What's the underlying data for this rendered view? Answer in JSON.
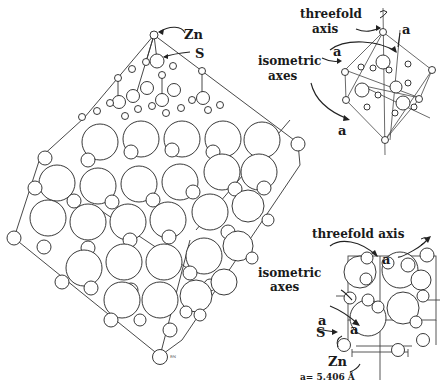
{
  "figure": {
    "panels": [
      {
        "id": "large-crystal",
        "labels": {
          "zn": "Zn",
          "s": "S",
          "corner_mark": "ᴿᴺ"
        }
      },
      {
        "id": "unit-cell-top",
        "labels": {
          "threefold_axis_line1": "threefold",
          "threefold_axis_line2": "axis",
          "isometric_axes_line1": "isometric",
          "isometric_axes_line2": "axes",
          "axis_a_top": "a",
          "axis_a_left": "a",
          "axis_a_bottom": "a"
        }
      },
      {
        "id": "unit-cell-bottom",
        "labels": {
          "threefold_axis": "threefold axis",
          "isometric_axes_line1": "isometric",
          "isometric_axes_line2": "axes",
          "axis_a_top": "a",
          "axis_a_left": "a",
          "axis_a_center": "a",
          "s": "S",
          "zn": "Zn",
          "lattice_constant": "a= 5.406 Å"
        }
      }
    ],
    "colors": {
      "ink": "#1a1a1a",
      "background": "#ffffff"
    }
  }
}
